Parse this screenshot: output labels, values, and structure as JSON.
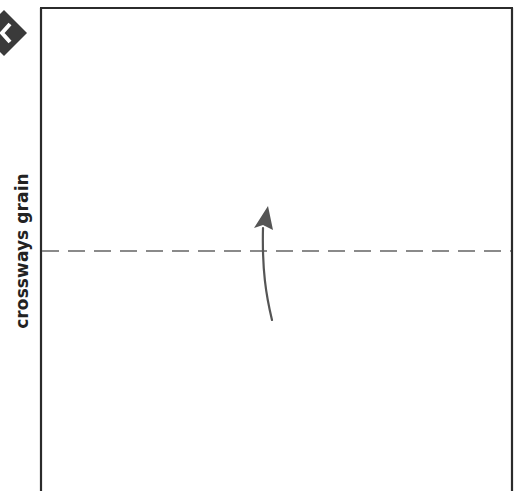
{
  "diagram": {
    "label": "crossways grain",
    "colors": {
      "frame": "#2b2b2b",
      "fold_line": "#8a8a8a",
      "arrow": "#555555",
      "badge": "#3a3a3a",
      "badge_glyph": "#ffffff",
      "label": "#222222"
    },
    "icons": {
      "badge": "chevron-left-diamond-icon",
      "arrow": "curved-up-arrow-icon"
    },
    "fold_line": {
      "style": "dashed",
      "orientation": "horizontal"
    }
  }
}
